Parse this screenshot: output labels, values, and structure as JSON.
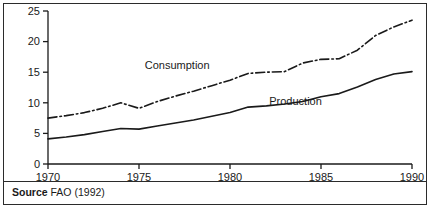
{
  "figure": {
    "source_prefix": "Source",
    "source_text": "FAO (1992)"
  },
  "chart_data": {
    "type": "line",
    "title": "",
    "subtitle": "",
    "xlabel": "",
    "ylabel": "",
    "xlim": [
      1970,
      1990
    ],
    "ylim": [
      0,
      25
    ],
    "grid": false,
    "legend_position": "inline-annotation",
    "xticks": [
      1970,
      1975,
      1980,
      1985,
      1990
    ],
    "xticklabels": [
      "1970",
      "1975",
      "1980",
      "1985",
      "1990"
    ],
    "yticks": [
      0,
      5,
      10,
      15,
      20,
      25
    ],
    "yticklabels": [
      "0",
      "5",
      "10",
      "15",
      "20",
      "25"
    ],
    "x": [
      1970,
      1971,
      1972,
      1973,
      1974,
      1975,
      1976,
      1977,
      1978,
      1979,
      1980,
      1981,
      1982,
      1983,
      1984,
      1985,
      1986,
      1987,
      1988,
      1989,
      1990
    ],
    "series": [
      {
        "name": "Consumption",
        "style": "dash-dot",
        "color": "#1a1a1a",
        "label_x": 1977.1,
        "label_y": 15.6,
        "values": [
          7.5,
          7.9,
          8.4,
          9.1,
          10.0,
          9.1,
          10.2,
          11.1,
          11.9,
          12.8,
          13.7,
          14.8,
          15.0,
          15.1,
          16.5,
          17.1,
          17.2,
          18.6,
          21.0,
          22.4,
          23.5
        ]
      },
      {
        "name": "Production",
        "style": "solid",
        "color": "#1a1a1a",
        "label_x": 1983.6,
        "label_y": 9.6,
        "values": [
          4.1,
          4.4,
          4.8,
          5.3,
          5.8,
          5.7,
          6.2,
          6.7,
          7.2,
          7.8,
          8.4,
          9.3,
          9.5,
          9.8,
          10.2,
          11.0,
          11.5,
          12.6,
          13.8,
          14.7,
          15.1
        ]
      }
    ],
    "annotations": [
      {
        "text": "Consumption",
        "x": 1977.1,
        "y": 15.6
      },
      {
        "text": "Production",
        "x": 1983.6,
        "y": 9.6
      }
    ]
  }
}
